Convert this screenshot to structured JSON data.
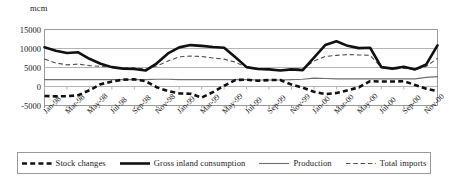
{
  "chart_data": {
    "type": "line",
    "title": "",
    "subtitle": "",
    "xlabel": "",
    "ylabel": "mcm",
    "unit_label": "mcm",
    "ylim": [
      -5000,
      15000
    ],
    "yticks": [
      15000,
      10000,
      5000,
      0,
      -5000
    ],
    "ytick_labels": [
      "15000",
      "10000",
      "5000",
      "0",
      "-5000"
    ],
    "grid": true,
    "legend_position": "bottom",
    "x": [
      "Jan-98",
      "Feb-98",
      "Mar-98",
      "Apr-98",
      "May-98",
      "Jun-98",
      "Jul-98",
      "Aug-98",
      "Sep-98",
      "Oct-98",
      "Nov-98",
      "Dec-98",
      "Jan-99",
      "Feb-99",
      "Mar-99",
      "Apr-99",
      "May-99",
      "Jun-99",
      "Jul-99",
      "Aug-99",
      "Sep-99",
      "Oct-99",
      "Nov-99",
      "Dec-99",
      "Jan-00",
      "Feb-00",
      "Mar-00",
      "Apr-00",
      "May-00",
      "Jun-00",
      "Jul-00",
      "Aug-00",
      "Sep-00",
      "Oct-00",
      "Nov-00",
      "Dec-00"
    ],
    "xtick_labels": [
      "Jan-98",
      "Mar-98",
      "May-98",
      "Jul-98",
      "Sep-98",
      "Nov-98",
      "Jan-99",
      "Mar-99",
      "May-99",
      "Jul-99",
      "Sep-99",
      "Nov-99",
      "Jan-00",
      "Mar-00",
      "May-00",
      "Jul-00",
      "Sep-00",
      "Nov-00"
    ],
    "series": [
      {
        "name": "Stock changes",
        "style": "thick-dashed",
        "color": "#111111",
        "values": [
          -2500,
          -2600,
          -2550,
          -2300,
          -1000,
          600,
          1300,
          1800,
          1900,
          1400,
          -200,
          -1200,
          -1800,
          -1900,
          -2900,
          -1500,
          200,
          1700,
          1800,
          1500,
          1700,
          1700,
          500,
          -300,
          -1400,
          -2000,
          -1700,
          -1000,
          -200,
          1400,
          1300,
          1300,
          1400,
          400,
          -600,
          -1200
        ]
      },
      {
        "name": "Gross inland consumption",
        "style": "thick-solid",
        "color": "#111111",
        "values": [
          10300,
          9400,
          8800,
          9000,
          7300,
          6000,
          5100,
          4700,
          4600,
          4200,
          6100,
          8700,
          10300,
          10900,
          10700,
          10400,
          10200,
          7700,
          5100,
          4600,
          4500,
          4200,
          4500,
          4300,
          7600,
          10900,
          11900,
          10700,
          10100,
          10200,
          5100,
          4700,
          5200,
          4500,
          5800,
          10800
        ]
      },
      {
        "name": "Production",
        "style": "thin-solid",
        "color": "#6f6f6f",
        "values": [
          1800,
          1800,
          1800,
          1800,
          1800,
          1800,
          1800,
          1800,
          1800,
          1800,
          1900,
          1900,
          1800,
          1800,
          1800,
          1800,
          1800,
          1800,
          1800,
          1700,
          1700,
          1700,
          1800,
          1900,
          2200,
          2100,
          2000,
          2000,
          2000,
          2000,
          2000,
          2000,
          2000,
          2000,
          2400,
          2600
        ]
      },
      {
        "name": "Total imports",
        "style": "thin-dashed",
        "color": "#4f4f4f",
        "values": [
          7200,
          6200,
          5700,
          5900,
          5500,
          5300,
          5100,
          4900,
          4900,
          4600,
          5400,
          6700,
          7800,
          8000,
          7900,
          7500,
          7200,
          6400,
          5000,
          4600,
          4500,
          4300,
          4600,
          4600,
          6700,
          7900,
          8200,
          8400,
          8300,
          8200,
          5000,
          4600,
          4800,
          4400,
          5300,
          7400
        ]
      }
    ]
  },
  "legend": {
    "entries": [
      {
        "label": "Stock changes",
        "style": "thick-dashed"
      },
      {
        "label": "Gross inland consumption",
        "style": "thick-solid"
      },
      {
        "label": "Production",
        "style": "thin-solid"
      },
      {
        "label": "Total imports",
        "style": "thin-dashed"
      }
    ]
  },
  "colors": {
    "plot_border": "#9a9a9a",
    "gridline": "#b5b5b5",
    "thick_series": "#111111",
    "production": "#6f6f6f",
    "imports": "#4f4f4f",
    "background": "#ffffff"
  }
}
